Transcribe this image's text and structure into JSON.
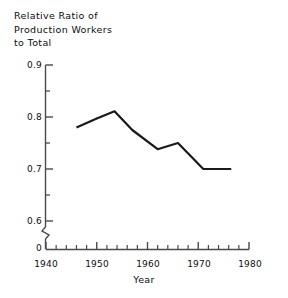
{
  "chart_data": {
    "type": "line",
    "title": "",
    "ylabel": "Relative Ratio of Production Workers to Total",
    "ylabel_lines": [
      "Relative Ratio of",
      "Production Workers",
      "to Total"
    ],
    "xlabel": "Year",
    "x": [
      1946,
      1950,
      1953.5,
      1957,
      1962,
      1966,
      1971,
      1976.5
    ],
    "values": [
      0.78,
      0.797,
      0.811,
      0.775,
      0.738,
      0.75,
      0.7,
      0.7
    ],
    "series": [
      {
        "name": "Relative Ratio of Production Workers to Total",
        "points": [
          {
            "x": 1946.0,
            "y": 0.78
          },
          {
            "x": 1950.0,
            "y": 0.797
          },
          {
            "x": 1953.5,
            "y": 0.811
          },
          {
            "x": 1957.0,
            "y": 0.775
          },
          {
            "x": 1962.0,
            "y": 0.738
          },
          {
            "x": 1966.0,
            "y": 0.75
          },
          {
            "x": 1971.0,
            "y": 0.7
          },
          {
            "x": 1976.5,
            "y": 0.7
          }
        ]
      }
    ],
    "xlim": [
      1940,
      1980
    ],
    "ylim": [
      0.6,
      0.9
    ],
    "y_axis_break": true,
    "y_break_label": "0",
    "grid": false,
    "legend": false,
    "legend_position": "none",
    "line_color": "#1a1a1a",
    "axis_color": "#4a4a4a",
    "background": "#ffffff",
    "ytick_labels": [
      "0.9",
      "0.8",
      "0.7",
      "0.6"
    ],
    "ytick_values": [
      0.9,
      0.8,
      0.7,
      0.6
    ],
    "yminor_values": [
      0.85,
      0.75,
      0.65
    ],
    "xtick_labels": [
      "1940",
      "1950",
      "1960",
      "1970",
      "1980"
    ],
    "xtick_values": [
      1940,
      1950,
      1960,
      1970,
      1980
    ],
    "xminor_values": [
      1942,
      1944,
      1946,
      1948,
      1952,
      1954,
      1956,
      1958,
      1962,
      1964,
      1966,
      1968,
      1972,
      1974,
      1976,
      1978
    ]
  },
  "axis": {
    "y_title_line1": "Relative Ratio of",
    "y_title_line2": "Production Workers",
    "y_title_line3": "to Total",
    "x_title": "Year",
    "y_tick_0": "0.9",
    "y_tick_1": "0.8",
    "y_tick_2": "0.7",
    "y_tick_3": "0.6",
    "y_tick_zero": "0",
    "x_tick_0": "1940",
    "x_tick_1": "1950",
    "x_tick_2": "1960",
    "x_tick_3": "1970",
    "x_tick_4": "1980"
  }
}
